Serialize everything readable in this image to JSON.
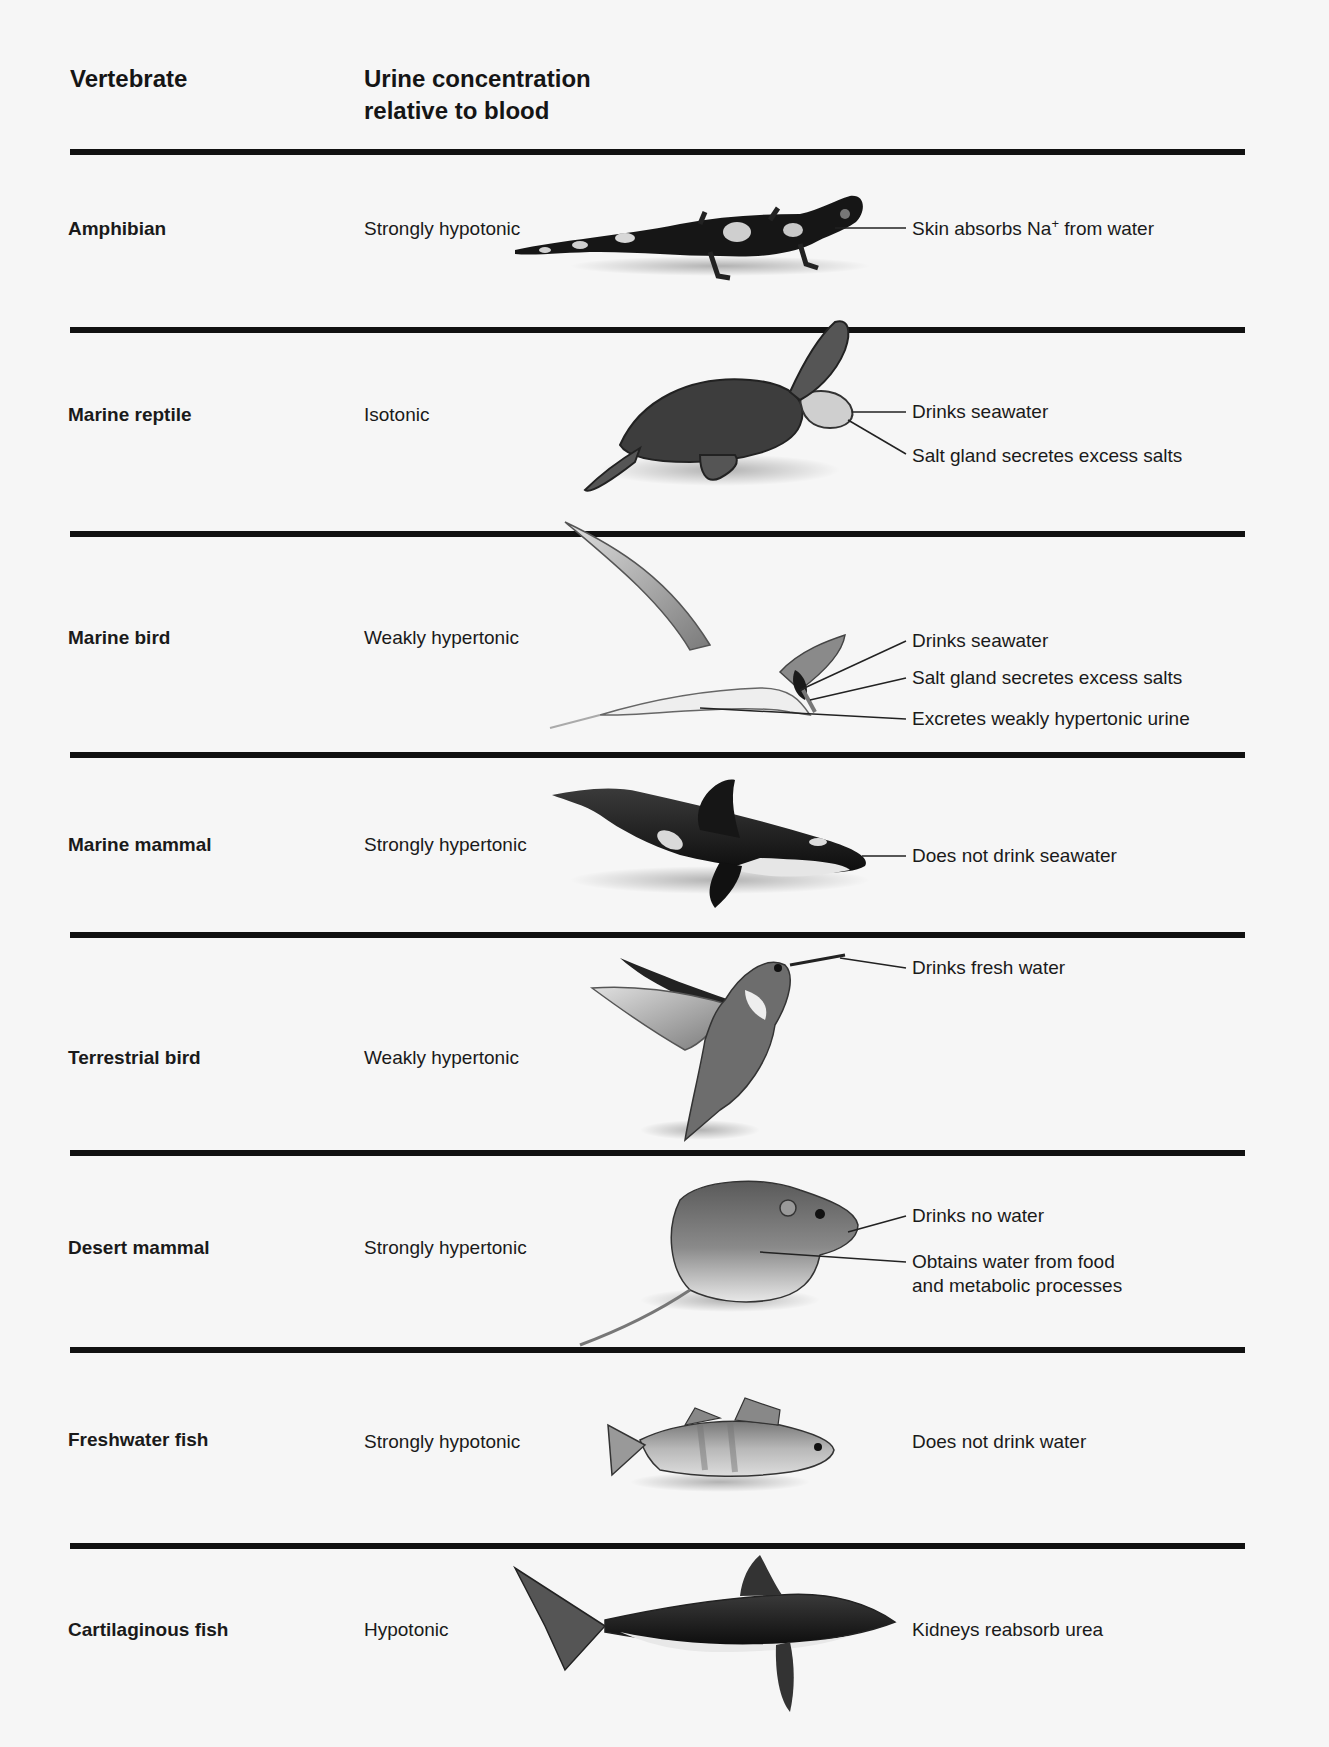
{
  "header": {
    "col1": "Vertebrate",
    "col2_line1": "Urine concentration",
    "col2_line2": "relative to blood"
  },
  "rows": [
    {
      "vertebrate": "Amphibian",
      "concentration": "Strongly hypotonic",
      "illustration": "salamander-icon",
      "notes": [
        {
          "text_pre": "Skin absorbs Na",
          "sup": "+",
          "text_post": " from water"
        }
      ]
    },
    {
      "vertebrate": "Marine reptile",
      "concentration": "Isotonic",
      "illustration": "sea-turtle-icon",
      "notes": [
        {
          "text": "Drinks seawater"
        },
        {
          "text": "Salt gland secretes excess salts"
        }
      ]
    },
    {
      "vertebrate": "Marine bird",
      "concentration": "Weakly hypertonic",
      "illustration": "tern-icon",
      "notes": [
        {
          "text": "Drinks seawater"
        },
        {
          "text": "Salt gland secretes excess salts"
        },
        {
          "text": "Excretes weakly hypertonic urine"
        }
      ]
    },
    {
      "vertebrate": "Marine mammal",
      "concentration": "Strongly hypertonic",
      "illustration": "orca-icon",
      "notes": [
        {
          "text": "Does not drink seawater"
        }
      ]
    },
    {
      "vertebrate": "Terrestrial bird",
      "concentration": "Weakly hypertonic",
      "illustration": "hummingbird-icon",
      "notes": [
        {
          "text": "Drinks fresh water"
        }
      ]
    },
    {
      "vertebrate": "Desert mammal",
      "concentration": "Strongly hypertonic",
      "illustration": "kangaroo-rat-icon",
      "notes": [
        {
          "text": "Drinks no water"
        },
        {
          "text_line1": "Obtains water from food",
          "text_line2": "and metabolic processes"
        }
      ]
    },
    {
      "vertebrate": "Freshwater fish",
      "concentration": "Strongly hypotonic",
      "illustration": "perch-icon",
      "notes": [
        {
          "text": "Does not drink water"
        }
      ]
    },
    {
      "vertebrate": "Cartilaginous fish",
      "concentration": "Hypotonic",
      "illustration": "shark-icon",
      "notes": [
        {
          "text": "Kidneys reabsorb urea"
        }
      ]
    }
  ],
  "colors": {
    "background": "#f6f6f6",
    "rule": "#111111",
    "text": "#1a1a1a"
  }
}
